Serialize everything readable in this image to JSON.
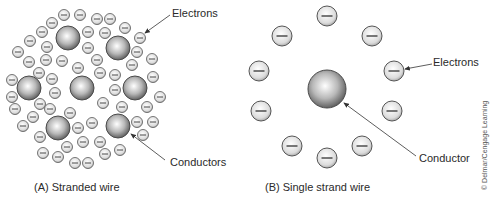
{
  "colors": {
    "background": "#ffffff",
    "outline": "#555555",
    "text": "#2a2a2a",
    "arrow": "#333333"
  },
  "panel_a": {
    "caption": "(A) Stranded wire",
    "labels": {
      "electrons": "Electrons",
      "conductors": "Conductors"
    },
    "conductors": [
      {
        "x": 68,
        "y": 38,
        "r": 12
      },
      {
        "x": 118,
        "y": 48,
        "r": 12
      },
      {
        "x": 29,
        "y": 88,
        "r": 12
      },
      {
        "x": 82,
        "y": 88,
        "r": 12
      },
      {
        "x": 135,
        "y": 88,
        "r": 12
      },
      {
        "x": 58,
        "y": 128,
        "r": 12
      },
      {
        "x": 118,
        "y": 126,
        "r": 12
      }
    ],
    "electrons": [
      [
        64,
        15
      ],
      [
        80,
        15
      ],
      [
        97,
        19
      ],
      [
        110,
        19
      ],
      [
        52,
        23
      ],
      [
        42,
        32
      ],
      [
        88,
        32
      ],
      [
        105,
        33
      ],
      [
        125,
        28
      ],
      [
        140,
        38
      ],
      [
        30,
        41
      ],
      [
        47,
        47
      ],
      [
        88,
        48
      ],
      [
        137,
        52
      ],
      [
        18,
        52
      ],
      [
        29,
        62
      ],
      [
        46,
        60
      ],
      [
        62,
        61
      ],
      [
        97,
        60
      ],
      [
        132,
        65
      ],
      [
        152,
        59
      ],
      [
        78,
        68
      ],
      [
        100,
        73
      ],
      [
        115,
        75
      ],
      [
        39,
        73
      ],
      [
        52,
        79
      ],
      [
        12,
        80
      ],
      [
        153,
        77
      ],
      [
        55,
        93
      ],
      [
        115,
        90
      ],
      [
        12,
        97
      ],
      [
        160,
        97
      ],
      [
        40,
        104
      ],
      [
        103,
        103
      ],
      [
        122,
        107
      ],
      [
        15,
        109
      ],
      [
        147,
        107
      ],
      [
        50,
        109
      ],
      [
        70,
        113
      ],
      [
        33,
        117
      ],
      [
        78,
        128
      ],
      [
        92,
        123
      ],
      [
        137,
        122
      ],
      [
        153,
        122
      ],
      [
        23,
        126
      ],
      [
        40,
        137
      ],
      [
        100,
        142
      ],
      [
        143,
        135
      ],
      [
        120,
        150
      ],
      [
        67,
        147
      ],
      [
        83,
        142
      ],
      [
        43,
        153
      ],
      [
        58,
        157
      ],
      [
        75,
        163
      ],
      [
        88,
        163
      ],
      [
        105,
        154
      ]
    ],
    "electron_radius": 5.5
  },
  "panel_b": {
    "caption": "(B) Single strand wire",
    "labels": {
      "electrons": "Electrons",
      "conductor": "Conductor"
    },
    "conductor": {
      "x": 327,
      "y": 89,
      "r": 19
    },
    "electrons": [
      [
        327,
        16
      ],
      [
        282,
        36
      ],
      [
        372,
        36
      ],
      [
        259,
        71
      ],
      [
        394,
        71
      ],
      [
        261,
        111
      ],
      [
        392,
        111
      ],
      [
        292,
        146
      ],
      [
        362,
        146
      ],
      [
        327,
        158
      ]
    ],
    "electron_radius": 10
  },
  "copyright": "© Delmar/Cengage Learning"
}
